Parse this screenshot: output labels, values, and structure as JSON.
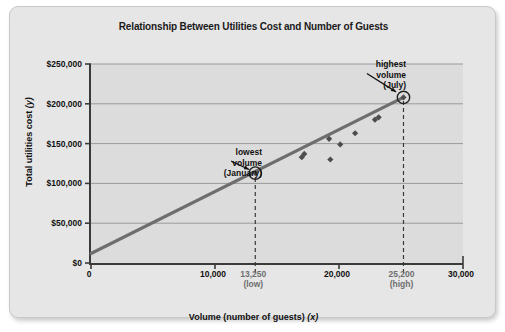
{
  "chart_data": {
    "type": "scatter",
    "title": "Relationship Between Utilities Cost and Number of Guests",
    "xlabel": "Volume (number of guests) (x)",
    "ylabel": "Total utilities cost (y)",
    "xlim": [
      0,
      30000
    ],
    "ylim": [
      0,
      250000
    ],
    "grid": true,
    "legend": "none",
    "x_ticks": [
      {
        "value": 0,
        "label": "0",
        "sublabel": "",
        "special": false
      },
      {
        "value": 10000,
        "label": "10,000",
        "sublabel": "",
        "special": false
      },
      {
        "value": 13250,
        "label": "13,250",
        "sublabel": "(low)",
        "special": true
      },
      {
        "value": 20000,
        "label": "20,000",
        "sublabel": "",
        "special": false
      },
      {
        "value": 25200,
        "label": "25,200",
        "sublabel": "(high)",
        "special": true
      },
      {
        "value": 30000,
        "label": "30,000",
        "sublabel": "",
        "special": false
      }
    ],
    "y_ticks": [
      {
        "value": 0,
        "label": "$0"
      },
      {
        "value": 50000,
        "label": "$50,000"
      },
      {
        "value": 100000,
        "label": "$100,000"
      },
      {
        "value": 150000,
        "label": "$150,000"
      },
      {
        "value": 200000,
        "label": "$200,000"
      },
      {
        "value": 250000,
        "label": "$250,000"
      }
    ],
    "points": [
      {
        "x": 13250,
        "y": 113000,
        "highlighted": true
      },
      {
        "x": 17000,
        "y": 133000,
        "highlighted": false
      },
      {
        "x": 17200,
        "y": 137000,
        "highlighted": false
      },
      {
        "x": 19200,
        "y": 156000,
        "highlighted": false
      },
      {
        "x": 19300,
        "y": 130000,
        "highlighted": false
      },
      {
        "x": 20100,
        "y": 149000,
        "highlighted": false
      },
      {
        "x": 21300,
        "y": 163000,
        "highlighted": false
      },
      {
        "x": 22900,
        "y": 180000,
        "highlighted": false
      },
      {
        "x": 23200,
        "y": 183000,
        "highlighted": false
      },
      {
        "x": 25200,
        "y": 208000,
        "highlighted": true
      }
    ],
    "trendline": {
      "x_start": 0,
      "y_start": 12000,
      "x_end": 25200,
      "y_end": 208000
    },
    "dropdown_lines": [
      13250,
      25200
    ],
    "annotations": [
      {
        "id": "lowest",
        "line1": "lowest",
        "line2": "volume",
        "line3": "(January)",
        "target_x": 13250,
        "target_y": 113000
      },
      {
        "id": "highest",
        "line1": "highest",
        "line2": "volume",
        "line3": "(July)",
        "target_x": 25200,
        "target_y": 208000
      }
    ],
    "colors": {
      "plot_background": "#dcdcdc",
      "card_background": "#e6e6e6",
      "axis": "#3a3a3a",
      "gridline": "#9a9a9a",
      "trendline": "#6e6e6e",
      "marker": "#4d4d4d",
      "text": "#111111",
      "muted_text": "#6f6f6f"
    }
  }
}
